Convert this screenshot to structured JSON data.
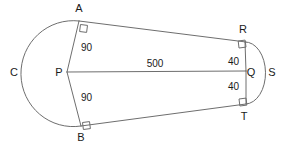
{
  "diagram": {
    "type": "geometry-figure",
    "colors": {
      "stroke": "#6e6e6e",
      "text": "#1a1a1a",
      "background": "#ffffff"
    },
    "vertices": [
      {
        "id": "A",
        "label": "A",
        "x": 79,
        "y": 21,
        "label_x": 79,
        "label_y": 12
      },
      {
        "id": "B",
        "label": "B",
        "x": 81,
        "y": 126,
        "label_x": 81,
        "label_y": 141
      },
      {
        "id": "C",
        "label": "C",
        "x": 22,
        "y": 72,
        "label_x": 14,
        "label_y": 76
      },
      {
        "id": "P",
        "label": "P",
        "x": 67,
        "y": 72,
        "label_x": 59,
        "label_y": 76
      },
      {
        "id": "Q",
        "label": "Q",
        "x": 246,
        "y": 71,
        "label_x": 250,
        "label_y": 76
      },
      {
        "id": "R",
        "label": "R",
        "x": 245,
        "y": 42,
        "label_x": 243,
        "label_y": 33
      },
      {
        "id": "S",
        "label": "S",
        "x": 265,
        "y": 72,
        "label_x": 271,
        "label_y": 76
      },
      {
        "id": "T",
        "label": "T",
        "x": 246,
        "y": 104,
        "label_x": 244,
        "label_y": 120
      }
    ],
    "measures": [
      {
        "id": "radius-pa",
        "value": "90",
        "x": 81,
        "y": 50
      },
      {
        "id": "radius-pb",
        "value": "90",
        "x": 81,
        "y": 100
      },
      {
        "id": "radius-qr",
        "value": "40",
        "x": 233,
        "y": 62
      },
      {
        "id": "radius-qt",
        "value": "40",
        "x": 233,
        "y": 87
      },
      {
        "id": "center-distance-pq",
        "value": "500",
        "x": 155,
        "y": 66
      }
    ],
    "segments": [
      {
        "id": "tangent-ar",
        "from": "A",
        "to": "R"
      },
      {
        "id": "tangent-bt",
        "from": "B",
        "to": "T"
      },
      {
        "id": "radius-line-pa",
        "from": "P",
        "to": "A"
      },
      {
        "id": "radius-line-pb",
        "from": "P",
        "to": "B"
      },
      {
        "id": "radius-line-qr",
        "from": "Q",
        "to": "R"
      },
      {
        "id": "radius-line-qt",
        "from": "Q",
        "to": "T"
      },
      {
        "id": "center-line-pq",
        "from": "P",
        "to": "Q"
      }
    ],
    "arcs": [
      {
        "id": "arc-acb",
        "through": "C",
        "from": "A",
        "to": "B",
        "radius": 90
      },
      {
        "id": "arc-rst",
        "through": "S",
        "from": "R",
        "to": "T",
        "radius": 40
      }
    ],
    "right_angles": [
      {
        "id": "right-angle-at-a",
        "at": "A"
      },
      {
        "id": "right-angle-at-b",
        "at": "B"
      },
      {
        "id": "right-angle-at-r",
        "at": "R"
      },
      {
        "id": "right-angle-at-t",
        "at": "T"
      }
    ]
  }
}
